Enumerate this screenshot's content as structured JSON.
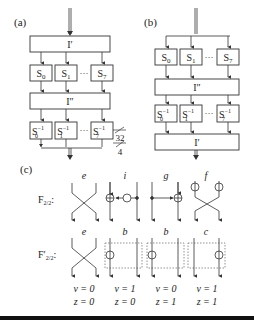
{
  "panels": {
    "a": {
      "label": "(a)",
      "top_block": "I′",
      "sboxes": [
        "S0",
        "S1",
        "S7"
      ],
      "mid_block": "I″",
      "inv_sboxes": [
        "S0-1",
        "S1-1",
        "S7-1"
      ],
      "ellipsis": "···"
    },
    "b": {
      "label": "(b)",
      "sboxes": [
        "S0",
        "S1",
        "S7"
      ],
      "mid_block": "I″",
      "inv_sboxes": [
        "S0-1",
        "S1-1",
        "S7-1"
      ],
      "bottom_block": "I′",
      "ellipsis": "···"
    },
    "bus_widths": {
      "wide": "32",
      "narrow": "4"
    },
    "c": {
      "label": "(c)",
      "row1_label": "F",
      "row1_subscript": "2/2",
      "row2_label": "F′",
      "row2_subscript": "2/2",
      "row1_cells": [
        {
          "letter": "e",
          "type": "cross"
        },
        {
          "letter": "i",
          "type": "xor-left"
        },
        {
          "letter": "g",
          "type": "xor-right"
        },
        {
          "letter": "f",
          "type": "cross-not"
        }
      ],
      "row2_cells": [
        {
          "letter": "e",
          "type": "cross",
          "v": "v = 0",
          "z": "z = 0"
        },
        {
          "letter": "b",
          "type": "not-left",
          "v": "v = 1",
          "z": "z = 0"
        },
        {
          "letter": "b",
          "type": "not-left",
          "v": "v = 0",
          "z": "z = 1"
        },
        {
          "letter": "c",
          "type": "not-right",
          "v": "v = 1",
          "z": "z = 1"
        }
      ]
    }
  },
  "colors": {
    "stroke": "#333333",
    "box_fill": "#ffffff",
    "dotted": "#777777",
    "bar": "#111111"
  }
}
